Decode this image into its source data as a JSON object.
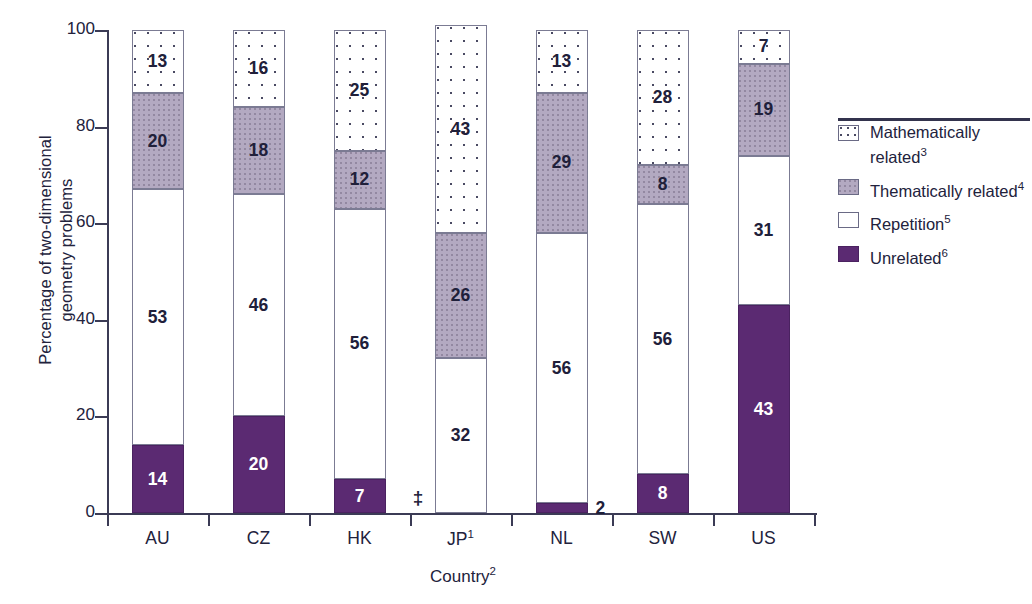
{
  "chart_data": {
    "type": "bar",
    "subtype": "stacked-100-percent",
    "title": "",
    "xlabel": "Country",
    "xlabel_sup": "2",
    "ylabel": "Percentage of two-dimensional\ngeometry problems",
    "ylim": [
      0,
      100
    ],
    "yticks": [
      0,
      20,
      40,
      60,
      80,
      100
    ],
    "ytick_labels": [
      "0",
      "20",
      "40",
      "60",
      "80",
      "100"
    ],
    "grid": false,
    "legend_position": "right",
    "categories": [
      "AU",
      "CZ",
      "HK",
      "JP",
      "NL",
      "SW",
      "US"
    ],
    "category_labels": [
      {
        "text": "AU",
        "sup": ""
      },
      {
        "text": "CZ",
        "sup": ""
      },
      {
        "text": "HK",
        "sup": ""
      },
      {
        "text": "JP",
        "sup": "1"
      },
      {
        "text": "NL",
        "sup": ""
      },
      {
        "text": "SW",
        "sup": ""
      },
      {
        "text": "US",
        "sup": ""
      }
    ],
    "series": [
      {
        "name": "Unrelated",
        "legend_sup": "6",
        "style": "solid-dark-purple",
        "color": "#5B2A72",
        "text_color": "#FFFFFF",
        "values": [
          14,
          20,
          7,
          null,
          2,
          8,
          43
        ],
        "labels": [
          "14",
          "20",
          "7",
          "‡",
          "2",
          "8",
          "43"
        ],
        "label_outside": [
          false,
          false,
          false,
          true,
          true,
          false,
          false
        ]
      },
      {
        "name": "Repetition",
        "legend_sup": "5",
        "style": "white",
        "color": "#FFFFFF",
        "text_color": "#20203A",
        "values": [
          53,
          46,
          56,
          32,
          56,
          56,
          31
        ],
        "labels": [
          "53",
          "46",
          "56",
          "32",
          "56",
          "56",
          "31"
        ],
        "label_outside": [
          false,
          false,
          false,
          false,
          false,
          false,
          false
        ]
      },
      {
        "name": "Thematically related",
        "legend_sup": "4",
        "style": "mauve",
        "color": "#B3A9C1",
        "text_color": "#20203A",
        "values": [
          20,
          18,
          12,
          26,
          29,
          8,
          19
        ],
        "labels": [
          "20",
          "18",
          "12",
          "26",
          "29",
          "8",
          "19"
        ],
        "label_outside": [
          false,
          false,
          false,
          false,
          false,
          false,
          false
        ]
      },
      {
        "name": "Mathematically related",
        "legend_sup": "3",
        "style": "dotted",
        "color": "#FFFFFF",
        "text_color": "#20203A",
        "values": [
          13,
          16,
          25,
          43,
          13,
          28,
          7
        ],
        "labels": [
          "13",
          "16",
          "25",
          "43",
          "13",
          "28",
          "7"
        ],
        "label_outside": [
          false,
          false,
          false,
          false,
          false,
          false,
          false
        ]
      }
    ],
    "notes": {
      "suppressed_symbol": "‡",
      "suppressed_categories": [
        "JP"
      ]
    }
  },
  "legend": {
    "items": [
      {
        "label": "Mathematically related",
        "sup": "3",
        "swatch": "math-swatch-icon"
      },
      {
        "label": "Thematically related",
        "sup": "4",
        "swatch": "thematic-swatch-icon"
      },
      {
        "label": "Repetition",
        "sup": "5",
        "swatch": "repetition-swatch-icon"
      },
      {
        "label": "Unrelated",
        "sup": "6",
        "swatch": "unrelated-swatch-icon"
      }
    ]
  }
}
